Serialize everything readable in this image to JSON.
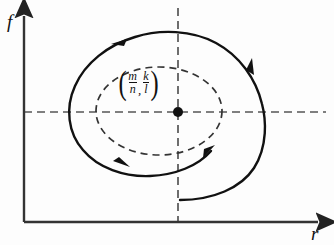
{
  "figure": {
    "type": "phase-plane-diagram",
    "background_color": "#fdfdfd",
    "line_color": "#111111",
    "dashed_color": "#555555"
  },
  "axes": {
    "y_label": "f",
    "x_label": "r",
    "origin": {
      "x": 24,
      "y": 222
    },
    "y_axis_top": {
      "x": 24,
      "y": 10
    },
    "x_axis_right": {
      "x": 326,
      "y": 222
    },
    "color": "#333333"
  },
  "equilibrium": {
    "label_open_paren": "(",
    "label_close_paren": ")",
    "x_numerator": "m",
    "x_denominator": "n",
    "separator": ",",
    "y_numerator": "k",
    "y_denominator": "l",
    "point": {
      "x": 178,
      "y": 112
    },
    "dot_color": "#111111",
    "dot_radius": 5
  },
  "crosshair": {
    "horizontal": {
      "x1": 24,
      "y1": 112,
      "x2": 326,
      "y2": 112
    },
    "vertical": {
      "x1": 178,
      "y1": 8,
      "x2": 178,
      "y2": 222
    },
    "dash_pattern": "8,5",
    "color": "#555555"
  },
  "inner_orbit": {
    "type": "dashed-closed-orbit",
    "center": {
      "x": 159,
      "y": 111
    },
    "radius_x": 63,
    "radius_y": 44,
    "dash_pattern": "7,5",
    "color": "#333333"
  },
  "outer_spiral": {
    "type": "solid-inward-spiral",
    "direction": "counterclockwise",
    "free_endpoint": {
      "x": 180,
      "y": 200
    },
    "color": "#111111",
    "stroke_width": 2.4,
    "arrow_count": 4
  },
  "arrows": [
    {
      "name": "arrow-top-left",
      "x": 119,
      "y": 43,
      "direction": "left"
    },
    {
      "name": "arrow-right",
      "x": 250,
      "y": 66,
      "direction": "up"
    },
    {
      "name": "arrow-bottom-left",
      "x": 120,
      "y": 163,
      "direction": "right"
    },
    {
      "name": "arrow-inner-bottom-right",
      "x": 212,
      "y": 148,
      "direction": "up-right"
    }
  ]
}
